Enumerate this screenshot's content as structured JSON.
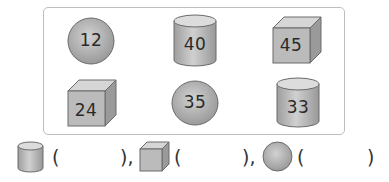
{
  "exercise": {
    "shapes": [
      {
        "type": "sphere",
        "value": "12"
      },
      {
        "type": "cylinder",
        "value": "40"
      },
      {
        "type": "cube",
        "value": "45"
      },
      {
        "type": "cube",
        "value": "24"
      },
      {
        "type": "sphere",
        "value": "35"
      },
      {
        "type": "cylinder",
        "value": "33"
      }
    ],
    "answer_row": [
      {
        "shape": "cylinder",
        "open": "(",
        "close": "),"
      },
      {
        "shape": "cube",
        "open": "(",
        "close": "),"
      },
      {
        "shape": "sphere",
        "open": "(",
        "close": ")"
      }
    ]
  },
  "colors": {
    "shape_fill": "#b5b5b5",
    "shape_dark": "#8c8c8c",
    "shape_light": "#d9d9d9",
    "outline": "#6a6a6a",
    "frame": "#bdbdbd"
  }
}
